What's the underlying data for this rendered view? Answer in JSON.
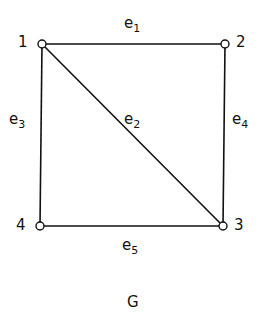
{
  "graph": {
    "caption": "G",
    "nodes": [
      {
        "id": "1",
        "label": "1",
        "x": 42,
        "y": 44
      },
      {
        "id": "2",
        "label": "2",
        "x": 225,
        "y": 44
      },
      {
        "id": "3",
        "label": "3",
        "x": 223,
        "y": 226
      },
      {
        "id": "4",
        "label": "4",
        "x": 40,
        "y": 226
      }
    ],
    "edges": [
      {
        "id": "e1",
        "base": "e",
        "sub": "1",
        "from": "1",
        "to": "2"
      },
      {
        "id": "e2",
        "base": "e",
        "sub": "2",
        "from": "1",
        "to": "3"
      },
      {
        "id": "e3",
        "base": "e",
        "sub": "3",
        "from": "1",
        "to": "4"
      },
      {
        "id": "e4",
        "base": "e",
        "sub": "4",
        "from": "2",
        "to": "3"
      },
      {
        "id": "e5",
        "base": "e",
        "sub": "5",
        "from": "4",
        "to": "3"
      }
    ]
  }
}
